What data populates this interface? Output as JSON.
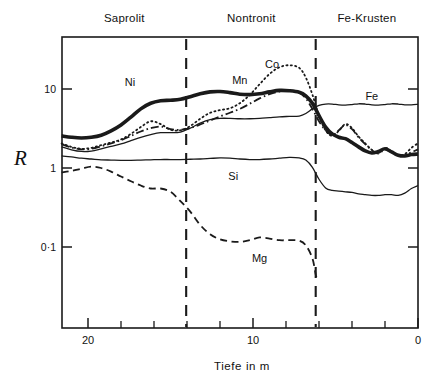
{
  "chart_data": {
    "type": "line",
    "title": "",
    "xlabel": "Tiefe  in  m",
    "ylabel": "R",
    "x_axis": {
      "ticks_major": [
        20,
        10,
        0
      ],
      "tick_labels": [
        "20",
        "10",
        "0"
      ],
      "minor_ticks": [
        22,
        18,
        16,
        14,
        12,
        8,
        6,
        4,
        2
      ],
      "range": [
        21.6,
        0
      ],
      "reversed": true,
      "unit": "m"
    },
    "y_axis": {
      "scale": "log",
      "ticks": [
        10,
        1,
        0.1
      ],
      "tick_labels": [
        "10",
        "1",
        "0·1"
      ],
      "range": [
        0.035,
        30
      ],
      "grid": false
    },
    "zones": [
      {
        "label": "Saprolit",
        "x_start": 21.6,
        "x_end": 14.05,
        "label_x": 17.8
      },
      {
        "label": "Nontronit",
        "x_start": 14.05,
        "x_end": 6.2,
        "label_x": 10.1
      },
      {
        "label": "Fe-Krusten",
        "x_start": 6.2,
        "x_end": 0,
        "label_x": 3.1
      }
    ],
    "zone_dividers": [
      14.05,
      6.2
    ],
    "legend_position": "inline-annotations",
    "series": [
      {
        "name": "Ni",
        "style": "thick-solid",
        "label_point": {
          "x": 17.45,
          "y": 12.2
        },
        "points": [
          [
            21.6,
            2.55
          ],
          [
            21.0,
            2.45
          ],
          [
            20.4,
            2.4
          ],
          [
            19.8,
            2.45
          ],
          [
            19.2,
            2.6
          ],
          [
            18.6,
            2.95
          ],
          [
            18.0,
            3.5
          ],
          [
            17.4,
            4.4
          ],
          [
            16.8,
            5.6
          ],
          [
            16.2,
            6.6
          ],
          [
            15.6,
            7.1
          ],
          [
            15.0,
            7.2
          ],
          [
            14.4,
            7.4
          ],
          [
            13.8,
            8.0
          ],
          [
            13.2,
            8.7
          ],
          [
            12.6,
            9.2
          ],
          [
            12.0,
            9.3
          ],
          [
            11.4,
            9.0
          ],
          [
            10.8,
            8.6
          ],
          [
            10.2,
            8.5
          ],
          [
            9.6,
            8.7
          ],
          [
            9.0,
            9.2
          ],
          [
            8.4,
            9.6
          ],
          [
            7.8,
            9.5
          ],
          [
            7.2,
            9.1
          ],
          [
            6.8,
            8.2
          ],
          [
            6.4,
            6.6
          ],
          [
            6.0,
            4.6
          ],
          [
            5.6,
            3.3
          ],
          [
            5.2,
            2.7
          ],
          [
            4.8,
            2.45
          ],
          [
            4.4,
            2.35
          ],
          [
            4.0,
            2.1
          ],
          [
            3.6,
            1.85
          ],
          [
            3.2,
            1.65
          ],
          [
            2.8,
            1.55
          ],
          [
            2.4,
            1.62
          ],
          [
            2.0,
            1.75
          ],
          [
            1.6,
            1.6
          ],
          [
            1.2,
            1.45
          ],
          [
            0.8,
            1.42
          ],
          [
            0.4,
            1.48
          ],
          [
            0.0,
            1.5
          ]
        ]
      },
      {
        "name": "Co",
        "style": "dotted",
        "label_point": {
          "x": 8.85,
          "y": 21.0
        },
        "points": [
          [
            21.6,
            2.05
          ],
          [
            21.0,
            1.85
          ],
          [
            20.4,
            1.75
          ],
          [
            19.8,
            1.8
          ],
          [
            19.2,
            1.95
          ],
          [
            18.6,
            2.1
          ],
          [
            18.0,
            2.3
          ],
          [
            17.4,
            2.7
          ],
          [
            16.8,
            3.3
          ],
          [
            16.2,
            3.9
          ],
          [
            15.6,
            3.6
          ],
          [
            15.0,
            3.05
          ],
          [
            14.4,
            3.0
          ],
          [
            13.8,
            3.4
          ],
          [
            13.2,
            4.2
          ],
          [
            12.6,
            5.0
          ],
          [
            12.0,
            5.4
          ],
          [
            11.4,
            5.7
          ],
          [
            10.8,
            6.6
          ],
          [
            10.2,
            8.4
          ],
          [
            9.6,
            11.5
          ],
          [
            9.0,
            15.5
          ],
          [
            8.4,
            18.8
          ],
          [
            7.8,
            20.0
          ],
          [
            7.2,
            18.5
          ],
          [
            6.8,
            14.0
          ],
          [
            6.4,
            8.5
          ],
          [
            6.0,
            4.6
          ],
          [
            5.6,
            3.0
          ],
          [
            5.2,
            2.55
          ],
          [
            4.8,
            2.95
          ],
          [
            4.4,
            3.6
          ],
          [
            4.0,
            3.2
          ],
          [
            3.6,
            2.5
          ],
          [
            3.2,
            2.05
          ],
          [
            2.8,
            1.7
          ],
          [
            2.4,
            1.55
          ],
          [
            2.0,
            1.8
          ],
          [
            1.6,
            1.62
          ],
          [
            1.2,
            1.45
          ],
          [
            0.8,
            1.5
          ],
          [
            0.4,
            1.8
          ],
          [
            0.0,
            2.05
          ]
        ]
      },
      {
        "name": "Mn",
        "style": "dash-dot",
        "label_point": {
          "x": 10.8,
          "y": 13.0
        },
        "points": [
          [
            21.6,
            2.0
          ],
          [
            21.0,
            1.82
          ],
          [
            20.4,
            1.72
          ],
          [
            19.8,
            1.75
          ],
          [
            19.2,
            1.88
          ],
          [
            18.6,
            2.05
          ],
          [
            18.0,
            2.25
          ],
          [
            17.4,
            2.55
          ],
          [
            16.8,
            2.9
          ],
          [
            16.2,
            3.2
          ],
          [
            15.6,
            3.35
          ],
          [
            15.0,
            3.1
          ],
          [
            14.4,
            3.05
          ],
          [
            13.8,
            3.2
          ],
          [
            13.2,
            3.55
          ],
          [
            12.6,
            4.0
          ],
          [
            12.0,
            4.5
          ],
          [
            11.4,
            5.0
          ],
          [
            10.8,
            5.6
          ],
          [
            10.2,
            6.5
          ],
          [
            9.6,
            7.6
          ],
          [
            9.0,
            8.6
          ],
          [
            8.4,
            9.3
          ],
          [
            7.8,
            9.5
          ],
          [
            7.2,
            9.0
          ],
          [
            6.8,
            7.6
          ],
          [
            6.4,
            5.6
          ],
          [
            6.0,
            3.9
          ],
          [
            5.6,
            3.0
          ],
          [
            5.2,
            2.6
          ],
          [
            4.8,
            3.0
          ],
          [
            4.4,
            3.5
          ],
          [
            4.0,
            3.1
          ],
          [
            3.6,
            2.45
          ],
          [
            3.2,
            2.0
          ],
          [
            2.8,
            1.68
          ],
          [
            2.4,
            1.52
          ],
          [
            2.0,
            1.72
          ],
          [
            1.6,
            1.58
          ],
          [
            1.2,
            1.42
          ],
          [
            0.8,
            1.44
          ],
          [
            0.4,
            1.58
          ],
          [
            0.0,
            1.72
          ]
        ]
      },
      {
        "name": "Fe",
        "style": "thin-solid",
        "label_point": {
          "x": 2.8,
          "y": 8.1
        },
        "points": [
          [
            21.6,
            1.85
          ],
          [
            21.0,
            1.7
          ],
          [
            20.4,
            1.62
          ],
          [
            19.8,
            1.64
          ],
          [
            19.2,
            1.75
          ],
          [
            18.6,
            1.88
          ],
          [
            18.0,
            2.02
          ],
          [
            17.4,
            2.22
          ],
          [
            16.8,
            2.45
          ],
          [
            16.2,
            2.65
          ],
          [
            15.6,
            2.8
          ],
          [
            15.0,
            2.8
          ],
          [
            14.4,
            2.85
          ],
          [
            13.8,
            3.2
          ],
          [
            13.2,
            3.7
          ],
          [
            12.6,
            4.1
          ],
          [
            12.0,
            4.25
          ],
          [
            11.4,
            4.25
          ],
          [
            10.8,
            4.2
          ],
          [
            10.2,
            4.2
          ],
          [
            9.6,
            4.25
          ],
          [
            9.0,
            4.35
          ],
          [
            8.4,
            4.45
          ],
          [
            7.8,
            4.5
          ],
          [
            7.2,
            4.55
          ],
          [
            6.8,
            4.9
          ],
          [
            6.4,
            5.6
          ],
          [
            6.0,
            6.2
          ],
          [
            5.6,
            6.45
          ],
          [
            5.2,
            6.45
          ],
          [
            4.8,
            6.3
          ],
          [
            4.4,
            6.25
          ],
          [
            4.0,
            6.35
          ],
          [
            3.6,
            6.5
          ],
          [
            3.2,
            6.45
          ],
          [
            2.8,
            6.3
          ],
          [
            2.4,
            6.25
          ],
          [
            2.0,
            6.35
          ],
          [
            1.6,
            6.5
          ],
          [
            1.2,
            6.45
          ],
          [
            0.8,
            6.3
          ],
          [
            0.4,
            6.3
          ],
          [
            0.0,
            6.4
          ]
        ]
      },
      {
        "name": "Si",
        "style": "thin-solid",
        "label_point": {
          "x": 11.2,
          "y": 0.79
        },
        "points": [
          [
            21.6,
            1.42
          ],
          [
            21.0,
            1.38
          ],
          [
            20.4,
            1.33
          ],
          [
            19.8,
            1.3
          ],
          [
            19.2,
            1.27
          ],
          [
            18.6,
            1.26
          ],
          [
            18.0,
            1.25
          ],
          [
            17.4,
            1.25
          ],
          [
            16.8,
            1.26
          ],
          [
            16.2,
            1.27
          ],
          [
            15.6,
            1.28
          ],
          [
            15.0,
            1.28
          ],
          [
            14.4,
            1.28
          ],
          [
            13.8,
            1.29
          ],
          [
            13.2,
            1.3
          ],
          [
            12.6,
            1.32
          ],
          [
            12.0,
            1.34
          ],
          [
            11.4,
            1.33
          ],
          [
            10.8,
            1.3
          ],
          [
            10.2,
            1.28
          ],
          [
            9.6,
            1.28
          ],
          [
            9.0,
            1.3
          ],
          [
            8.4,
            1.33
          ],
          [
            7.8,
            1.36
          ],
          [
            7.2,
            1.34
          ],
          [
            6.8,
            1.26
          ],
          [
            6.4,
            1.02
          ],
          [
            6.0,
            0.72
          ],
          [
            5.6,
            0.56
          ],
          [
            5.2,
            0.52
          ],
          [
            4.8,
            0.51
          ],
          [
            4.4,
            0.5
          ],
          [
            4.0,
            0.49
          ],
          [
            3.6,
            0.47
          ],
          [
            3.2,
            0.46
          ],
          [
            2.8,
            0.45
          ],
          [
            2.4,
            0.45
          ],
          [
            2.0,
            0.46
          ],
          [
            1.6,
            0.46
          ],
          [
            1.2,
            0.45
          ],
          [
            0.8,
            0.48
          ],
          [
            0.4,
            0.55
          ],
          [
            0.0,
            0.6
          ]
        ]
      },
      {
        "name": "Mg",
        "style": "dashed",
        "label_point": {
          "x": 9.6,
          "y": 0.073
        },
        "points": [
          [
            21.6,
            0.88
          ],
          [
            21.0,
            0.92
          ],
          [
            20.4,
            0.98
          ],
          [
            19.8,
            1.04
          ],
          [
            19.2,
            1.0
          ],
          [
            18.6,
            0.9
          ],
          [
            18.0,
            0.78
          ],
          [
            17.4,
            0.68
          ],
          [
            16.8,
            0.6
          ],
          [
            16.2,
            0.55
          ],
          [
            15.6,
            0.55
          ],
          [
            15.0,
            0.5
          ],
          [
            14.4,
            0.38
          ],
          [
            13.8,
            0.28
          ],
          [
            13.2,
            0.19
          ],
          [
            12.6,
            0.145
          ],
          [
            12.0,
            0.125
          ],
          [
            11.4,
            0.118
          ],
          [
            10.8,
            0.116
          ],
          [
            10.2,
            0.122
          ],
          [
            9.6,
            0.132
          ],
          [
            9.0,
            0.128
          ],
          [
            8.4,
            0.122
          ],
          [
            7.8,
            0.122
          ],
          [
            7.2,
            0.12
          ],
          [
            6.8,
            0.105
          ],
          [
            6.4,
            0.072
          ],
          [
            6.2,
            0.045
          ],
          [
            6.1,
            0.038
          ]
        ]
      }
    ]
  },
  "annotations": {
    "series_labels": [
      "Ni",
      "Co",
      "Mn",
      "Fe",
      "Si",
      "Mg"
    ],
    "zone_labels": [
      "Saprolit",
      "Nontronit",
      "Fe-Krusten"
    ]
  },
  "colors": {
    "ink": "#1a1a1a",
    "background": "#ffffff"
  }
}
